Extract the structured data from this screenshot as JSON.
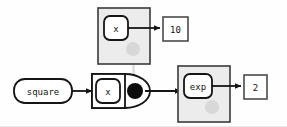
{
  "diagram": {
    "type": "node-graph",
    "background_color": "#fefefe",
    "colors": {
      "stroke": "#151515",
      "group_fill": "#ececec",
      "group_stroke": "#3a3a3a",
      "node_fill": "#ffffff",
      "dot_filled": "#0b0b0b",
      "dot_ghost": "#d8d8d8",
      "ghost_link": "#dcdcdc",
      "value_box_fill": "#ffffff",
      "value_box_stroke": "#4a4a4a"
    },
    "groups": [
      {
        "id": "group-top",
        "label": "",
        "x": 98,
        "y": 8,
        "width": 52,
        "height": 56,
        "port_label": ""
      },
      {
        "id": "group-exp",
        "label": "",
        "x": 178,
        "y": 66,
        "width": 52,
        "height": 56,
        "port_label": ""
      }
    ],
    "nodes": [
      {
        "id": "node-square",
        "label": "square",
        "shape": "rounded-pill",
        "x": 14,
        "y": 79,
        "width": 58,
        "height": 24
      },
      {
        "id": "node-x-top",
        "label": "x",
        "shape": "rounded-square",
        "x": 104,
        "y": 16,
        "width": 24,
        "height": 24
      },
      {
        "id": "node-x-mid",
        "label": "x",
        "shape": "rounded-square",
        "x": 96,
        "y": 79,
        "width": 24,
        "height": 24
      },
      {
        "id": "node-exp",
        "label": "exp",
        "shape": "rounded-square",
        "x": 184,
        "y": 74,
        "width": 28,
        "height": 24
      }
    ],
    "value_boxes": [
      {
        "id": "value-10",
        "label": "10",
        "x": 163,
        "y": 17,
        "width": 25,
        "height": 24
      },
      {
        "id": "value-2",
        "label": "2",
        "x": 244,
        "y": 75,
        "width": 23,
        "height": 24
      }
    ],
    "ports": [
      {
        "id": "port-ghost-top",
        "state": "ghost",
        "cx": 133,
        "cy": 49,
        "r": 7
      },
      {
        "id": "port-filled-mid",
        "state": "filled",
        "cx": 135,
        "cy": 91,
        "r": 8
      },
      {
        "id": "port-ghost-exp",
        "state": "ghost",
        "cx": 212,
        "cy": 107,
        "r": 7
      }
    ],
    "edges": [
      {
        "id": "edge-square-to-x-mid",
        "from": "node-square",
        "to": "node-x-mid",
        "arrow": true
      },
      {
        "id": "edge-x-top-to-10",
        "from": "node-x-top",
        "to": "value-10",
        "arrow": true
      },
      {
        "id": "edge-mid-to-exp",
        "from": "port-filled-mid",
        "to": "node-exp",
        "arrow": true
      },
      {
        "id": "edge-exp-to-2",
        "from": "node-exp",
        "to": "value-2",
        "arrow": true
      },
      {
        "id": "edge-ghost-link",
        "from": "port-ghost-top",
        "to": "port-filled-mid",
        "arrow": false,
        "style": "ghost"
      }
    ]
  }
}
